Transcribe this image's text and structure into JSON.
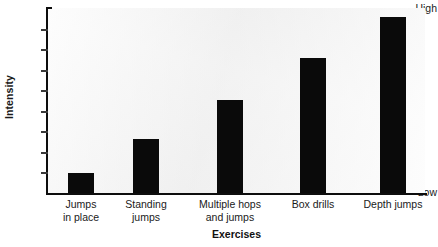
{
  "chart_data": {
    "type": "bar",
    "title": "",
    "xlabel": "Exercises",
    "ylabel": "Intensity",
    "categories": [
      "Jumps\nin place",
      "Standing\njumps",
      "Multiple hops\nand jumps",
      "Box drills",
      "Depth jumps"
    ],
    "category_lines": [
      [
        "Jumps",
        "in place"
      ],
      [
        "Standing",
        "jumps"
      ],
      [
        "Multiple hops",
        "and jumps"
      ],
      [
        "Box drills",
        ""
      ],
      [
        "Depth jumps",
        ""
      ]
    ],
    "values": [
      11,
      29,
      50,
      73,
      95
    ],
    "ylim": [
      0,
      100
    ],
    "ytick_labels": [
      "High",
      "Low"
    ],
    "ytick_label_high": "High",
    "ytick_label_low": "Low",
    "ytick_count": 8,
    "grid": false,
    "legend": null,
    "bar_color": "#0a0a0a",
    "plot_background": "#f2f2f2",
    "axis_color": "#0d0d0d"
  },
  "axes": {
    "y_title": "Intensity",
    "x_title": "Exercises",
    "y_top_label": "High",
    "y_bottom_label": "Low"
  }
}
